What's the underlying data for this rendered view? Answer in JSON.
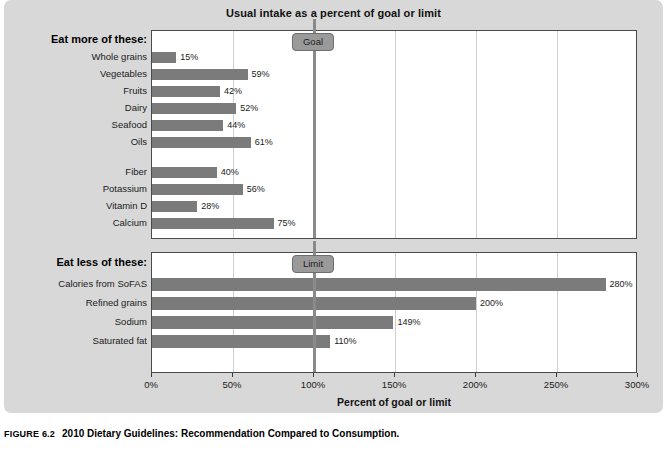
{
  "chart_data": {
    "type": "bar",
    "orientation": "horizontal",
    "title": "Usual intake as a percent of goal or limit",
    "xlabel": "Percent of goal or limit",
    "ylabel": "",
    "xlim": [
      0,
      300
    ],
    "xticks": [
      0,
      50,
      100,
      150,
      200,
      250,
      300
    ],
    "xtick_labels": [
      "0%",
      "50%",
      "100%",
      "150%",
      "200%",
      "250%",
      "300%"
    ],
    "grid": true,
    "legend": "none",
    "panels": [
      {
        "heading": "Eat more of these:",
        "reference_line": {
          "label": "Goal",
          "value": 100
        },
        "groups": [
          {
            "categories": [
              "Whole grains",
              "Vegetables",
              "Fruits",
              "Dairy",
              "Seafood",
              "Oils"
            ],
            "values": [
              15,
              59,
              42,
              52,
              44,
              61
            ],
            "value_labels": [
              "15%",
              "59%",
              "42%",
              "52%",
              "44%",
              "61%"
            ]
          },
          {
            "categories": [
              "Fiber",
              "Potassium",
              "Vitamin D",
              "Calcium"
            ],
            "values": [
              40,
              56,
              28,
              75
            ],
            "value_labels": [
              "40%",
              "56%",
              "28%",
              "75%"
            ]
          }
        ]
      },
      {
        "heading": "Eat less of these:",
        "reference_line": {
          "label": "Limit",
          "value": 100
        },
        "groups": [
          {
            "categories": [
              "Calories from SoFAS",
              "Refined grains",
              "Sodium",
              "Saturated fat"
            ],
            "values": [
              280,
              200,
              149,
              110
            ],
            "value_labels": [
              "280%",
              "200%",
              "149%",
              "110%"
            ]
          }
        ]
      }
    ]
  },
  "caption": {
    "figure_number": "FIGURE 6.2",
    "text": "2010 Dietary Guidelines: Recommendation Compared to Consumption."
  },
  "colors": {
    "bar": "#7b7b7b",
    "reference_line": "#8a8a8a",
    "panel_background": "#d8d8d8",
    "plot_background": "#ffffff",
    "gridline": "#cfcfcf"
  }
}
